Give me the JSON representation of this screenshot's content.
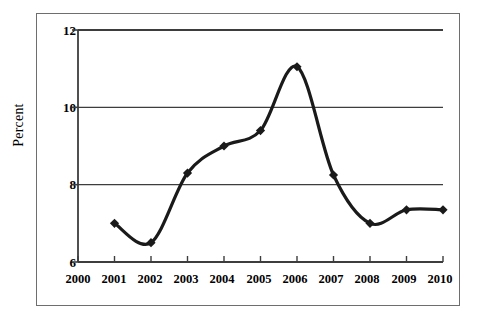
{
  "chart_data": {
    "type": "line",
    "title": "",
    "xlabel": "",
    "ylabel": "Percent",
    "categories": [
      "2000",
      "2001",
      "2002",
      "2003",
      "2004",
      "2005",
      "2006",
      "2007",
      "2008",
      "2009",
      "2010"
    ],
    "x": [
      2000,
      2001,
      2002,
      2003,
      2004,
      2005,
      2006,
      2007,
      2008,
      2009,
      2010
    ],
    "values": [
      null,
      7.0,
      6.5,
      8.3,
      9.0,
      9.4,
      11.05,
      8.25,
      7.0,
      7.35,
      7.35
    ],
    "series": [
      {
        "name": "Percent",
        "values": [
          null,
          7.0,
          6.5,
          8.3,
          9.0,
          9.4,
          11.05,
          8.25,
          7.0,
          7.35,
          7.35
        ],
        "color": "#1a1a1a",
        "marker": "diamond",
        "smooth": true
      }
    ],
    "xlim": [
      2000,
      2010
    ],
    "ylim": [
      6,
      12
    ],
    "yticks": [
      6,
      8,
      10,
      12
    ],
    "ytick_labels": [
      "6",
      "8",
      "10",
      "12"
    ],
    "xticks": [
      2000,
      2001,
      2002,
      2003,
      2004,
      2005,
      2006,
      2007,
      2008,
      2009,
      2010
    ],
    "grid": "horizontal",
    "grid_color": "#3d3d3d",
    "legend": false,
    "legend_position": "none",
    "annotations": []
  },
  "axes": {
    "y_title": "Percent",
    "y_tick_labels": [
      "12",
      "10",
      "8",
      "6"
    ],
    "x_tick_labels": [
      "2000",
      "2001",
      "2002",
      "2003",
      "2004",
      "2005",
      "2006",
      "2007",
      "2008",
      "2009",
      "2010"
    ]
  },
  "style": {
    "frame_color": "#6e6e6e",
    "axis_color": "#3d3d3d",
    "line_color": "#1a1a1a",
    "background": "#ffffff"
  }
}
